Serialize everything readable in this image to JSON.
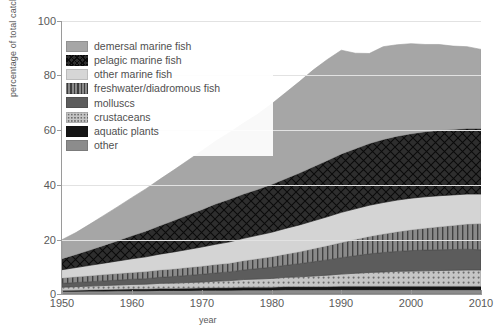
{
  "chart_data": {
    "type": "area",
    "subtype": "stacked-area",
    "title": "",
    "xlabel": "year",
    "ylabel": "percentage of total catch",
    "xlim": [
      1950,
      2010
    ],
    "ylim": [
      0,
      100
    ],
    "xticks": [
      1950,
      1960,
      1970,
      1980,
      1990,
      2000,
      2010
    ],
    "yticks": [
      0,
      20,
      40,
      60,
      80,
      100
    ],
    "grid": "horizontal",
    "legend_position": "upper-left-inside",
    "x": [
      1950,
      1952,
      1954,
      1956,
      1958,
      1960,
      1962,
      1964,
      1966,
      1968,
      1970,
      1972,
      1974,
      1976,
      1978,
      1980,
      1982,
      1984,
      1986,
      1988,
      1990,
      1992,
      1994,
      1996,
      1998,
      2000,
      2002,
      2004,
      2006,
      2008,
      2010
    ],
    "series": [
      {
        "name": "other",
        "pattern": "solid",
        "color": "#8c8c8c",
        "values": [
          1.0,
          1.0,
          1.1,
          1.1,
          1.2,
          1.2,
          1.2,
          1.3,
          1.3,
          1.3,
          1.4,
          1.4,
          1.4,
          1.5,
          1.5,
          1.5,
          1.6,
          1.6,
          1.6,
          1.6,
          1.6,
          1.6,
          1.6,
          1.6,
          1.6,
          1.6,
          1.6,
          1.6,
          1.6,
          1.6,
          1.6
        ]
      },
      {
        "name": "aquatic plants",
        "pattern": "solid-dark",
        "color": "#151515",
        "values": [
          0.3,
          0.4,
          0.4,
          0.5,
          0.5,
          0.6,
          0.6,
          0.7,
          0.7,
          0.8,
          0.8,
          0.9,
          0.9,
          1.0,
          1.0,
          1.0,
          1.1,
          1.1,
          1.1,
          1.1,
          1.2,
          1.2,
          1.2,
          1.2,
          1.2,
          1.2,
          1.2,
          1.2,
          1.2,
          1.2,
          1.2
        ]
      },
      {
        "name": "crustaceans",
        "pattern": "dotted",
        "color": "#b8b8b8",
        "values": [
          1.2,
          1.3,
          1.4,
          1.5,
          1.6,
          1.7,
          1.8,
          1.9,
          2.0,
          2.1,
          2.2,
          2.4,
          2.6,
          2.8,
          3.0,
          3.2,
          3.4,
          3.6,
          3.9,
          4.2,
          4.5,
          4.8,
          5.1,
          5.3,
          5.5,
          5.6,
          5.7,
          5.8,
          5.9,
          6.0,
          6.0
        ]
      },
      {
        "name": "molluscs",
        "pattern": "solid-mid",
        "color": "#5c5c5c",
        "values": [
          1.4,
          1.5,
          1.6,
          1.7,
          1.8,
          1.9,
          2.0,
          2.2,
          2.4,
          2.6,
          2.8,
          3.0,
          3.2,
          3.5,
          3.8,
          4.1,
          4.4,
          4.8,
          5.2,
          5.6,
          6.0,
          6.4,
          6.8,
          7.1,
          7.3,
          7.5,
          7.6,
          7.6,
          7.6,
          7.6,
          7.4
        ]
      },
      {
        "name": "freshwater/diadromous fish",
        "pattern": "vertical-lines",
        "color": "#7a7a7a",
        "values": [
          2.0,
          2.1,
          2.2,
          2.3,
          2.4,
          2.5,
          2.6,
          2.7,
          2.8,
          2.9,
          3.0,
          3.1,
          3.2,
          3.4,
          3.6,
          3.8,
          4.1,
          4.4,
          4.8,
          5.2,
          5.6,
          6.0,
          6.4,
          6.8,
          7.2,
          7.6,
          8.0,
          8.4,
          8.8,
          9.2,
          9.6
        ]
      },
      {
        "name": "other marine fish",
        "pattern": "light-solid",
        "color": "#d4d4d4",
        "values": [
          3.0,
          3.4,
          3.8,
          4.2,
          4.6,
          5.0,
          5.4,
          5.8,
          6.2,
          6.6,
          7.0,
          7.4,
          7.8,
          8.2,
          8.6,
          9.0,
          9.4,
          9.8,
          10.2,
          10.6,
          11.0,
          11.2,
          11.4,
          11.5,
          11.6,
          11.6,
          11.5,
          11.4,
          11.2,
          11.0,
          10.8
        ]
      },
      {
        "name": "pelagic marine fish",
        "pattern": "crosshatch",
        "color": "#2e2e2e",
        "values": [
          4.0,
          4.8,
          5.6,
          6.5,
          7.4,
          8.4,
          9.4,
          10.4,
          11.5,
          12.6,
          13.7,
          14.8,
          15.6,
          16.2,
          16.8,
          17.5,
          18.2,
          19.0,
          19.8,
          20.6,
          21.4,
          22.0,
          22.6,
          23.1,
          23.4,
          23.6,
          23.8,
          23.9,
          24.0,
          24.0,
          24.0
        ]
      },
      {
        "name": "demersal marine fish",
        "pattern": "grey-solid",
        "color": "#a6a6a6",
        "values": [
          7.0,
          8.0,
          9.5,
          11.0,
          12.5,
          14.0,
          15.5,
          17.0,
          18.5,
          20.0,
          21.5,
          23.0,
          24.5,
          26.0,
          27.5,
          29.5,
          31.5,
          33.5,
          35.5,
          37.0,
          38.0,
          35.0,
          33.0,
          34.0,
          33.5,
          33.0,
          32.0,
          31.5,
          30.5,
          30.0,
          29.0
        ]
      }
    ],
    "stack_top_total": [
      20,
      22,
      25,
      28,
      31,
      35,
      38,
      42,
      46,
      50,
      53,
      57,
      61,
      65,
      68,
      73,
      78,
      83,
      88,
      91,
      93,
      88,
      87,
      90,
      91,
      92,
      91,
      90,
      89,
      90,
      89
    ]
  },
  "axes": {
    "y": {
      "label": "percentage of total catch",
      "ticks": [
        "100",
        "80",
        "60",
        "40",
        "20",
        "0"
      ]
    },
    "x": {
      "label": "year",
      "ticks": [
        "1950",
        "1960",
        "1970",
        "1980",
        "1990",
        "2000",
        "2010"
      ]
    }
  },
  "legend": {
    "items": [
      {
        "label": "demersal marine fish",
        "swatch": "grey-solid",
        "color": "#a6a6a6"
      },
      {
        "label": "pelagic marine fish",
        "swatch": "crosshatch",
        "color": "#2e2e2e"
      },
      {
        "label": "other marine fish",
        "swatch": "light-solid",
        "color": "#d4d4d4"
      },
      {
        "label": "freshwater/diadromous fish",
        "swatch": "vertical-lines",
        "color": "#7a7a7a"
      },
      {
        "label": "molluscs",
        "swatch": "solid-mid",
        "color": "#5c5c5c"
      },
      {
        "label": "crustaceans",
        "swatch": "dotted",
        "color": "#b8b8b8"
      },
      {
        "label": "aquatic plants",
        "swatch": "solid-dark",
        "color": "#151515"
      },
      {
        "label": "other",
        "swatch": "solid",
        "color": "#8c8c8c"
      }
    ]
  },
  "colors": {
    "grid": "#e2e2e2",
    "axis": "#9a9a9a",
    "text": "#5a5a5a",
    "background": "#ffffff"
  }
}
